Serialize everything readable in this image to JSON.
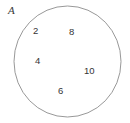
{
  "diagram": {
    "type": "set-diagram",
    "set_label": "A",
    "shape": "circle",
    "stroke_color": "#8c8c8c",
    "fill_color": "#ffffff",
    "background_color": "#ffffff",
    "text_color": "#343434",
    "label_color": "#3a3a3a",
    "elements": [
      {
        "value": "2"
      },
      {
        "value": "8"
      },
      {
        "value": "4"
      },
      {
        "value": "10"
      },
      {
        "value": "6"
      }
    ]
  }
}
